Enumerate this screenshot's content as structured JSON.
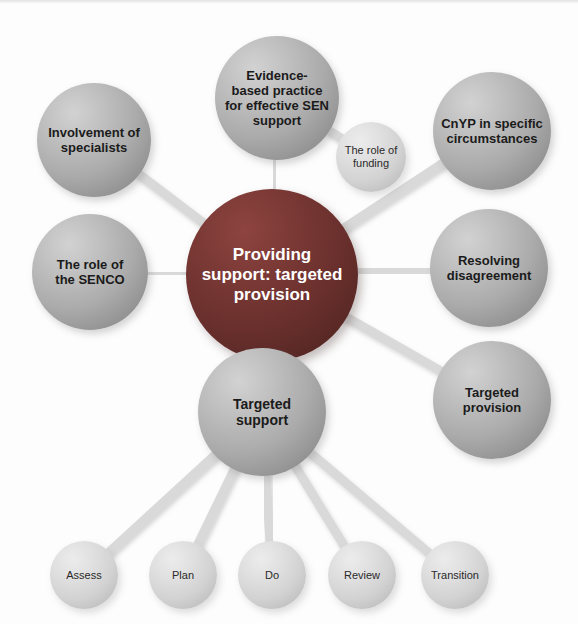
{
  "diagram": {
    "title": "Providing support: targeted provision",
    "type": "mind-map",
    "canvas": {
      "width": 578,
      "height": 624
    },
    "colors": {
      "hub_fill": "#6a302d",
      "hub_text": "#ffffff",
      "branch_fill": "#ababab",
      "branch_text": "#1b1b1b",
      "leaf_fill": "#d2d2d2",
      "leaf_text": "#2a2a2a",
      "edge": "#d9d9d9",
      "background": "#fdfdfd"
    },
    "nodes": [
      {
        "id": "hub",
        "label": "Providing\nsupport: targeted\nprovision",
        "style": "hub",
        "cx": 272,
        "cy": 275,
        "r": 86,
        "font_size": 17
      },
      {
        "id": "evidence",
        "label": "Evidence-\nbased practice\nfor effective SEN\nsupport",
        "style": "gray",
        "cx": 277,
        "cy": 98,
        "r": 62,
        "font_size": 13
      },
      {
        "id": "funding",
        "label": "The role of\nfunding",
        "style": "light",
        "cx": 371,
        "cy": 157,
        "r": 35,
        "font_size": 11
      },
      {
        "id": "cnyp",
        "label": "CnYP in specific\ncircumstances",
        "style": "gray",
        "cx": 492,
        "cy": 131,
        "r": 59,
        "font_size": 13
      },
      {
        "id": "specialists",
        "label": "Involvement of\nspecialists",
        "style": "gray",
        "cx": 94,
        "cy": 140,
        "r": 57,
        "font_size": 13
      },
      {
        "id": "senco",
        "label": "The role of\nthe SENCO",
        "style": "gray",
        "cx": 90,
        "cy": 272,
        "r": 58,
        "font_size": 13
      },
      {
        "id": "resolving",
        "label": "Resolving\ndisagreement",
        "style": "gray",
        "cx": 489,
        "cy": 268,
        "r": 59,
        "font_size": 13
      },
      {
        "id": "targeted-provision",
        "label": "Targeted\nprovision",
        "style": "gray",
        "cx": 492,
        "cy": 400,
        "r": 59,
        "font_size": 13
      },
      {
        "id": "targeted-support",
        "label": "Targeted\nsupport",
        "style": "gray",
        "cx": 262,
        "cy": 412,
        "r": 64,
        "font_size": 14
      },
      {
        "id": "assess",
        "label": "Assess",
        "style": "light",
        "cx": 84,
        "cy": 575,
        "r": 34,
        "font_size": 11
      },
      {
        "id": "plan",
        "label": "Plan",
        "style": "light",
        "cx": 183,
        "cy": 575,
        "r": 34,
        "font_size": 11
      },
      {
        "id": "do",
        "label": "Do",
        "style": "light",
        "cx": 272,
        "cy": 575,
        "r": 34,
        "font_size": 11
      },
      {
        "id": "review",
        "label": "Review",
        "style": "light",
        "cx": 362,
        "cy": 575,
        "r": 34,
        "font_size": 11
      },
      {
        "id": "transition",
        "label": "Transition",
        "style": "light",
        "cx": 455,
        "cy": 575,
        "r": 34,
        "font_size": 11
      }
    ],
    "edges": [
      {
        "from": "hub",
        "to": "evidence"
      },
      {
        "from": "hub",
        "to": "cnyp"
      },
      {
        "from": "hub",
        "to": "specialists"
      },
      {
        "from": "hub",
        "to": "senco"
      },
      {
        "from": "hub",
        "to": "resolving"
      },
      {
        "from": "hub",
        "to": "targeted-provision"
      },
      {
        "from": "hub",
        "to": "targeted-support"
      },
      {
        "from": "evidence",
        "to": "funding"
      },
      {
        "from": "targeted-support",
        "to": "assess"
      },
      {
        "from": "targeted-support",
        "to": "plan"
      },
      {
        "from": "targeted-support",
        "to": "do"
      },
      {
        "from": "targeted-support",
        "to": "review"
      },
      {
        "from": "targeted-support",
        "to": "transition"
      }
    ]
  }
}
